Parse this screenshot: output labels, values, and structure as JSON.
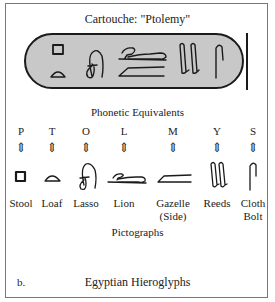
{
  "title": "Cartouche: \"Ptolemy\"",
  "cartouche": {
    "glyphs": [
      "stool-square",
      "loaf",
      "lasso",
      "lion",
      "gazelle-side",
      "reeds",
      "cloth-bolt"
    ]
  },
  "phonetic_heading": "Phonetic Equivalents",
  "columns": [
    {
      "letter": "P",
      "arrow": "⇕",
      "glyph": "stool-icon",
      "label": "Stool"
    },
    {
      "letter": "T",
      "arrow": "⇕",
      "glyph": "loaf-icon",
      "label": "Loaf"
    },
    {
      "letter": "O",
      "arrow": "⇕",
      "glyph": "lasso-icon",
      "label": "Lasso"
    },
    {
      "letter": "L",
      "arrow": "⇕",
      "glyph": "lion-icon",
      "label": "Lion"
    },
    {
      "letter": "M",
      "arrow": "⇕",
      "glyph": "gazelle-icon",
      "label": "Gazelle",
      "label2": "(Side)"
    },
    {
      "letter": "Y",
      "arrow": "⇕",
      "glyph": "reeds-icon",
      "label": "Reeds"
    },
    {
      "letter": "S",
      "arrow": "⇕",
      "glyph": "cloth-bolt-icon",
      "label": "Cloth",
      "label2": "Bolt"
    }
  ],
  "pictographs_heading": "Pictographs",
  "caption_letter": "b.",
  "caption": "Egyptian Hieroglyphs"
}
